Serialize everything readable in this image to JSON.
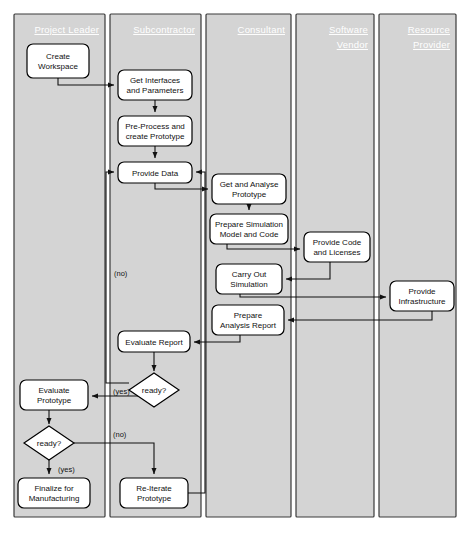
{
  "diagram": {
    "colors": {
      "lane_fill": "#d4d4d4",
      "lane_stroke": "#3a3a3a",
      "node_fill": "#ffffff",
      "node_stroke": "#000000",
      "edge": "#111111",
      "lane_title": "#ffffff",
      "background": "#ffffff"
    },
    "lanes": [
      {
        "id": "project-leader",
        "label": "Project Leader",
        "x": 14,
        "y": 14,
        "w": 91,
        "h": 503
      },
      {
        "id": "subcontractor",
        "label": "Subcontractor",
        "x": 110,
        "y": 14,
        "w": 91,
        "h": 503
      },
      {
        "id": "consultant",
        "label": "Consultant",
        "x": 206,
        "y": 14,
        "w": 85,
        "h": 503
      },
      {
        "id": "software-vendor",
        "label": "Software Vendor",
        "x": 296,
        "y": 14,
        "w": 78,
        "h": 503
      },
      {
        "id": "resource-provider",
        "label": "Resource Provider",
        "x": 379,
        "y": 14,
        "w": 77,
        "h": 503
      }
    ],
    "nodes": [
      {
        "id": "create-workspace",
        "label": "Create Workspace",
        "lines": [
          "Create",
          "Workspace"
        ],
        "shape": "rounded-rect",
        "x": 27,
        "y": 44,
        "w": 62,
        "h": 34
      },
      {
        "id": "get-interfaces",
        "label": "Get Interfaces and Parameters",
        "lines": [
          "Get Interfaces",
          "and Parameters"
        ],
        "shape": "rounded-rect",
        "x": 118,
        "y": 70,
        "w": 74,
        "h": 30
      },
      {
        "id": "pre-process",
        "label": "Pre-Process and create Prototype",
        "lines": [
          "Pre-Process and",
          "create Prototype"
        ],
        "shape": "rounded-rect",
        "x": 118,
        "y": 116,
        "w": 74,
        "h": 30
      },
      {
        "id": "provide-data",
        "label": "Provide Data",
        "lines": [
          "Provide Data"
        ],
        "shape": "rounded-rect",
        "x": 118,
        "y": 162,
        "w": 74,
        "h": 21
      },
      {
        "id": "get-analyse-prototype",
        "label": "Get and Analyse Prototype",
        "lines": [
          "Get and Analyse",
          "Prototype"
        ],
        "shape": "rounded-rect",
        "x": 212,
        "y": 174,
        "w": 74,
        "h": 30
      },
      {
        "id": "prepare-simulation",
        "label": "Prepare Simulation Model and Code",
        "lines": [
          "Prepare Simulation",
          "Model and Code"
        ],
        "shape": "rounded-rect",
        "x": 210,
        "y": 214,
        "w": 78,
        "h": 30
      },
      {
        "id": "provide-code",
        "label": "Provide Code and Licenses",
        "lines": [
          "Provide Code",
          "and Licenses"
        ],
        "shape": "rounded-rect",
        "x": 304,
        "y": 232,
        "w": 66,
        "h": 30
      },
      {
        "id": "carry-out-simulation",
        "label": "Carry Out Simulation",
        "lines": [
          "Carry Out",
          "Simulation"
        ],
        "shape": "rounded-rect",
        "x": 216,
        "y": 264,
        "w": 66,
        "h": 30
      },
      {
        "id": "provide-infrastructure",
        "label": "Provide Infrastructure",
        "lines": [
          "Provide",
          "Infrastructure"
        ],
        "shape": "rounded-rect",
        "x": 390,
        "y": 281,
        "w": 64,
        "h": 30
      },
      {
        "id": "prepare-analysis",
        "label": "Prepare Analysis Report",
        "lines": [
          "Prepare",
          "Analysis Report"
        ],
        "shape": "rounded-rect",
        "x": 212,
        "y": 305,
        "w": 72,
        "h": 30
      },
      {
        "id": "evaluate-report",
        "label": "Evaluate Report",
        "lines": [
          "Evaluate Report"
        ],
        "shape": "rounded-rect",
        "x": 118,
        "y": 331,
        "w": 72,
        "h": 21
      },
      {
        "id": "evaluate-prototype",
        "label": "Evaluate Prototype",
        "lines": [
          "Evaluate",
          "Prototype"
        ],
        "shape": "rounded-rect",
        "x": 20,
        "y": 380,
        "w": 68,
        "h": 30
      },
      {
        "id": "finalize-manufacturing",
        "label": "Finalize for Manufacturing",
        "lines": [
          "Finalize for",
          "Manufacturing"
        ],
        "shape": "rounded-rect",
        "x": 18,
        "y": 478,
        "w": 72,
        "h": 30
      },
      {
        "id": "re-iterate-prototype",
        "label": "Re-Iterate Prototype",
        "lines": [
          "Re-Iterate",
          "Prototype"
        ],
        "shape": "rounded-rect",
        "x": 120,
        "y": 478,
        "w": 68,
        "h": 30
      }
    ],
    "decisions": [
      {
        "id": "ready-report",
        "label": "ready?",
        "cx": 154,
        "cy": 390,
        "rx": 25,
        "ry": 17
      },
      {
        "id": "ready-prototype",
        "label": "ready?",
        "cx": 49,
        "cy": 443,
        "rx": 25,
        "ry": 17
      }
    ],
    "edge_labels": [
      {
        "id": "label-no-report",
        "text": "(no)",
        "x": 114,
        "y": 276
      },
      {
        "id": "label-yes-report",
        "text": "(yes)",
        "x": 113,
        "y": 394
      },
      {
        "id": "label-no-prototype",
        "text": "(no)",
        "x": 113,
        "y": 437
      },
      {
        "id": "label-yes-prototype",
        "text": "(yes)",
        "x": 58,
        "y": 472
      }
    ],
    "edges": [
      {
        "id": "e-create-to-getinterfaces",
        "from": "create-workspace",
        "to": "get-interfaces",
        "path": "M58,78 L58,85 L114,85"
      },
      {
        "id": "e-getinterfaces-to-preprocess",
        "from": "get-interfaces",
        "to": "pre-process",
        "path": "M155,100 L155,112"
      },
      {
        "id": "e-preprocess-to-providedata",
        "from": "pre-process",
        "to": "provide-data",
        "path": "M155,146 L155,158"
      },
      {
        "id": "e-providedata-to-getanalyse",
        "from": "provide-data",
        "to": "get-analyse-prototype",
        "path": "M155,183 L155,189 L208,189"
      },
      {
        "id": "e-getanalyse-to-preparesim",
        "from": "get-analyse-prototype",
        "to": "prepare-simulation",
        "path": "M249,204 L249,210"
      },
      {
        "id": "e-preparesim-to-providecode",
        "from": "prepare-simulation",
        "to": "provide-code",
        "path": "M227,244 L227,249 L300,249"
      },
      {
        "id": "e-providecode-to-carryout",
        "from": "provide-code",
        "to": "carry-out-simulation",
        "path": "M330,262 L330,279 L286,279"
      },
      {
        "id": "e-carryout-to-infra",
        "from": "carry-out-simulation",
        "to": "provide-infrastructure",
        "path": "M240,294 L240,297 L386,297"
      },
      {
        "id": "e-infra-to-prepareanalysis",
        "from": "provide-infrastructure",
        "to": "prepare-analysis",
        "path": "M432,311 L432,320 L288,320"
      },
      {
        "id": "e-prepareanalysis-to-evaluatereport",
        "from": "prepare-analysis",
        "to": "evaluate-report",
        "path": "M240,335 L240,342 L194,342"
      },
      {
        "id": "e-evaluatereport-to-ready",
        "from": "evaluate-report",
        "to": "ready-report",
        "path": "M154,352 L154,371"
      },
      {
        "id": "e-ready-no-to-providedata",
        "from": "ready-report",
        "to": "provide-data",
        "path": "M129,383 L106,383 L106,172 L114,172"
      },
      {
        "id": "e-ready-yes-to-evaluateproto",
        "from": "ready-report",
        "to": "evaluate-prototype",
        "path": "M154,407 L154,396 L92,396"
      },
      {
        "id": "e-evaluateproto-to-ready2",
        "from": "evaluate-prototype",
        "to": "ready-prototype",
        "path": "M49,410 L49,424"
      },
      {
        "id": "e-ready2-yes-to-finalize",
        "from": "ready-prototype",
        "to": "finalize-manufacturing",
        "path": "M49,460 L49,474"
      },
      {
        "id": "e-ready2-no-to-reiterate",
        "from": "ready-prototype",
        "to": "re-iterate-prototype",
        "path": "M74,443 L154,443 L154,474"
      },
      {
        "id": "e-reiterate-to-providedata",
        "from": "re-iterate-prototype",
        "to": "provide-data",
        "path": "M188,493 L205,493 L205,172 L196,172"
      }
    ]
  }
}
